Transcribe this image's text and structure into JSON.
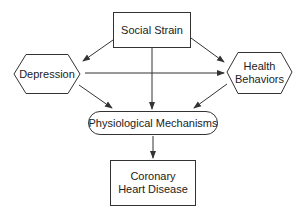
{
  "diagram": {
    "nodes": {
      "social_strain": {
        "label": "Social Strain",
        "shape": "rectangle"
      },
      "depression": {
        "label": "Depression",
        "shape": "hexagon"
      },
      "health_behaviors": {
        "label_line1": "Health",
        "label_line2": "Behaviors",
        "shape": "hexagon"
      },
      "physiological": {
        "label": "Physiological Mechanisms",
        "shape": "rounded-pill"
      },
      "chd": {
        "label_line1": "Coronary",
        "label_line2": "Heart Disease",
        "shape": "rectangle"
      }
    },
    "edges": [
      {
        "from": "Social Strain",
        "to": "Depression"
      },
      {
        "from": "Social Strain",
        "to": "Health Behaviors"
      },
      {
        "from": "Social Strain",
        "to": "Physiological Mechanisms"
      },
      {
        "from": "Depression",
        "to": "Health Behaviors"
      },
      {
        "from": "Depression",
        "to": "Physiological Mechanisms"
      },
      {
        "from": "Health Behaviors",
        "to": "Physiological Mechanisms"
      },
      {
        "from": "Physiological Mechanisms",
        "to": "Coronary Heart Disease"
      }
    ],
    "colors": {
      "stroke": "#333333",
      "background": "#ffffff"
    }
  }
}
